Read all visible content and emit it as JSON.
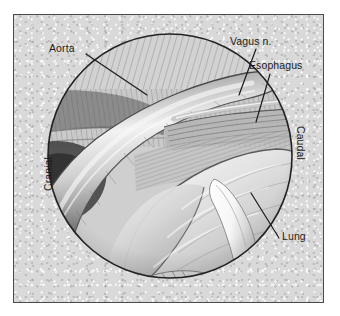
{
  "figure": {
    "kind": "surgical-anatomy-illustration",
    "view_shape": "circular-endoscopic-field",
    "colors": {
      "background": "#d9d9d9",
      "frame_border": "#4b4b4b",
      "circle_outline": "#222222",
      "leader_line": "#1b1b1b",
      "text": "#1b1b1b",
      "instrument": "#fdfdfd"
    }
  },
  "labels": {
    "aorta": "Aorta",
    "vagus_nerve": "Vagus n.",
    "esophagus": "Esophagus",
    "lung": "Lung",
    "cranial": "Cranial",
    "caudal": "Caudal"
  }
}
